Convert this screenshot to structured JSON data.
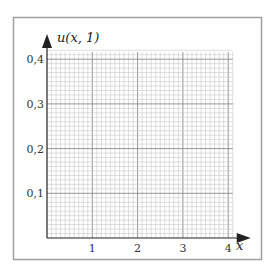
{
  "chart_data": {
    "type": "line",
    "title": "",
    "xlabel": "x",
    "ylabel": "u(x, 1)",
    "xlim": [
      0,
      4.1
    ],
    "ylim": [
      0,
      0.416
    ],
    "x_ticks": [
      1,
      2,
      3,
      4
    ],
    "x_tick_labels": [
      "1",
      "2",
      "3",
      "4"
    ],
    "y_ticks": [
      0.1,
      0.2,
      0.3,
      0.4
    ],
    "y_tick_labels": [
      "0,1",
      "0,2",
      "0,3",
      "0,4"
    ],
    "grid": true,
    "grid_minor_x_step": 0.1,
    "grid_minor_y_step": 0.01,
    "grid_major_x_step": 1,
    "grid_major_y_step": 0.1,
    "series": [],
    "legend": null,
    "note": "Empty graph paper for sketching u(x,1)"
  },
  "colors": {
    "frame": "#a0a0a0",
    "grid_minor": "#c8c8c8",
    "grid_major": "#8a8a8a",
    "axis": "#222222"
  }
}
